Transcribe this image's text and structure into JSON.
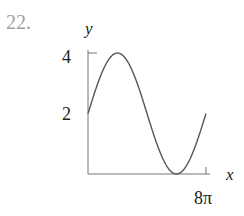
{
  "problem": {
    "number": "22."
  },
  "chart_data": {
    "type": "line",
    "title": "",
    "xlabel": "x",
    "ylabel": "y",
    "x_tick_labels": [
      "8π"
    ],
    "y_tick_labels": [
      "2",
      "4"
    ],
    "xlim": [
      0,
      25.1327
    ],
    "ylim": [
      0,
      4
    ],
    "grid": false,
    "legend": null,
    "function": "y = 2 + 2 sin(x/4)",
    "series": [
      {
        "name": "curve",
        "x": [
          0,
          3.1416,
          6.2832,
          9.4248,
          12.5664,
          15.708,
          18.8496,
          21.9911,
          25.1327
        ],
        "x_labels": [
          "0",
          "π",
          "2π",
          "3π",
          "4π",
          "5π",
          "6π",
          "7π",
          "8π"
        ],
        "values": [
          2,
          3.414,
          4,
          3.414,
          2,
          0.586,
          0,
          0.586,
          2
        ]
      }
    ]
  },
  "labels": {
    "y_axis": "y",
    "x_axis": "x",
    "y_tick_4": "4",
    "y_tick_2": "2",
    "x_tick_end": "8π"
  },
  "colors": {
    "curve": "#555555",
    "axis": "#777777",
    "number": "#a0a0a0"
  }
}
